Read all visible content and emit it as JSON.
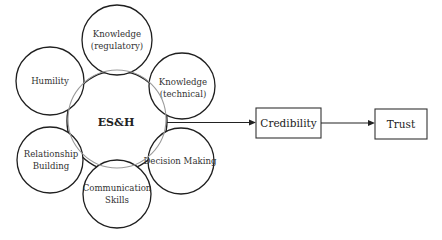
{
  "diagram": {
    "hub": {
      "label": "ES&H"
    },
    "nodes": [
      {
        "id": "knowledge-regulatory",
        "line1": "Knowledge",
        "line2": "(regulatory)"
      },
      {
        "id": "knowledge-technical",
        "line1": "Knowledge",
        "line2": "(technical)"
      },
      {
        "id": "decision-making",
        "line1": "Decision Making",
        "line2": ""
      },
      {
        "id": "communication-skills",
        "line1": "Communication",
        "line2": "Skills"
      },
      {
        "id": "relationship-building",
        "line1": "Relationship",
        "line2": "Building"
      },
      {
        "id": "humility",
        "line1": "Humility",
        "line2": ""
      }
    ],
    "flow": [
      {
        "id": "credibility",
        "label": "Credibility"
      },
      {
        "id": "trust",
        "label": "Trust"
      }
    ],
    "colors": {
      "stroke": "#1f1f1f",
      "inner_ring": "#9a9a9a",
      "background": "#ffffff"
    }
  }
}
